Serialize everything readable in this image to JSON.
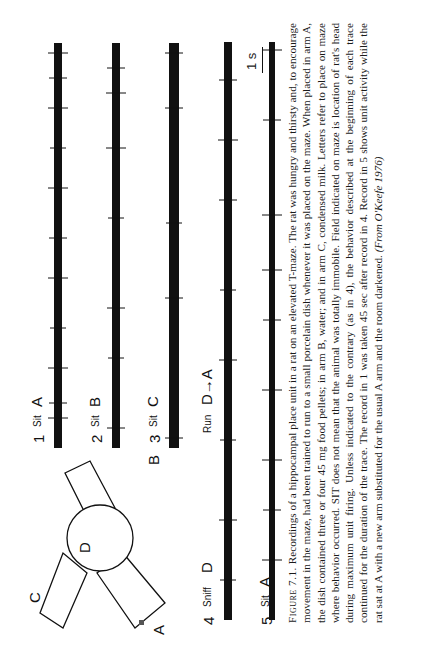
{
  "figure": {
    "maze": {
      "arms": [
        "A",
        "B",
        "C"
      ],
      "center": "D"
    },
    "traces": [
      {
        "number": "1",
        "behavior": "Sit",
        "place": "A"
      },
      {
        "number": "2",
        "behavior": "Sit",
        "place": "B"
      },
      {
        "number": "3",
        "behavior": "Sit",
        "place": "C"
      },
      {
        "number": "4",
        "behavior": "Sniff",
        "place": "D",
        "behavior2": "Run",
        "place2": "D→A"
      },
      {
        "number": "5",
        "behavior": "Sit",
        "place": "A"
      }
    ],
    "scale_bar": "1 s"
  },
  "caption": {
    "label": "Figure 7.1.",
    "text": "Recordings of a hippocampal place unit in a rat on an elevated T-maze. The rat was hungry and thirsty and, to encourage movement in the maze, had been trained to run to a small porcelain dish whenever it was placed on the maze. When placed in arm A, the dish contained three or four 45 mg food pellets; in arm B, water; and in arm C, condensed milk. Letters refer to place on maze where behavior occurred. SIT does not mean that the animal was totally immobile. Field indicated on maze is location of rat's head during maximum unit firing. Unless indicated to the contrary (as in 4), the behavior described at the beginning of each trace continued for the duration of the trace. The record in 1 was taken 45 sec after record in 4. Record in 5 shows unit activity while the rat sat at A with a new arm substituted for the usual A arm and the room darkened.",
    "source": "(From O'Keefe 1976)"
  }
}
